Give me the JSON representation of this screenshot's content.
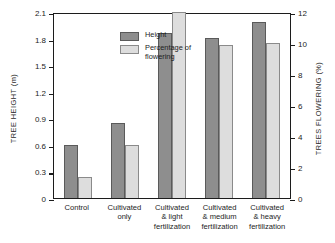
{
  "chart_data": {
    "type": "bar",
    "title": "",
    "categories": [
      "Control",
      "Cultivated only",
      "Cultivated & light fertilization",
      "Cultivated & medium fertilization",
      "Cultivated & heavy fertilization"
    ],
    "category_lines": [
      [
        "Control"
      ],
      [
        "Cultivated",
        "only"
      ],
      [
        "Cultivated",
        "& light",
        "fertilization"
      ],
      [
        "Cultivated",
        "& medium",
        "fertilization"
      ],
      [
        "Cultivated",
        "& heavy",
        "fertilization"
      ]
    ],
    "series": [
      {
        "name": "Height",
        "axis": "left",
        "unit": "m",
        "color": "#8e8e8e",
        "values": [
          0.6,
          0.85,
          1.86,
          1.81,
          1.99
        ]
      },
      {
        "name": "Percentage of flowering",
        "axis": "right",
        "unit": "%",
        "color": "#dddddd",
        "values": [
          1.35,
          3.4,
          12.0,
          9.9,
          10.0
        ]
      }
    ],
    "xlabel": "",
    "ylabel": "TREE HEIGHT (m)",
    "ylabel_right": "TREES FLOWERING (%)",
    "ylim": [
      0,
      2.1
    ],
    "yticks": [
      "0",
      "0.3",
      "0.6",
      "0.9",
      "1.2",
      "1.5",
      "1.8",
      "2.1"
    ],
    "ytick_values": [
      0,
      0.3,
      0.6,
      0.9,
      1.2,
      1.5,
      1.8,
      2.1
    ],
    "ylim_right": [
      0,
      12
    ],
    "yticks_right": [
      "0",
      "2",
      "4",
      "6",
      "8",
      "10",
      "12"
    ],
    "ytick_values_right": [
      0,
      2,
      4,
      6,
      8,
      10,
      12
    ],
    "grid": false,
    "legend_position": "top-left",
    "legend": [
      {
        "label": "Height",
        "color": "#8e8e8e"
      },
      {
        "label": "Percentage of\nflowering",
        "color": "#dddddd"
      }
    ]
  }
}
